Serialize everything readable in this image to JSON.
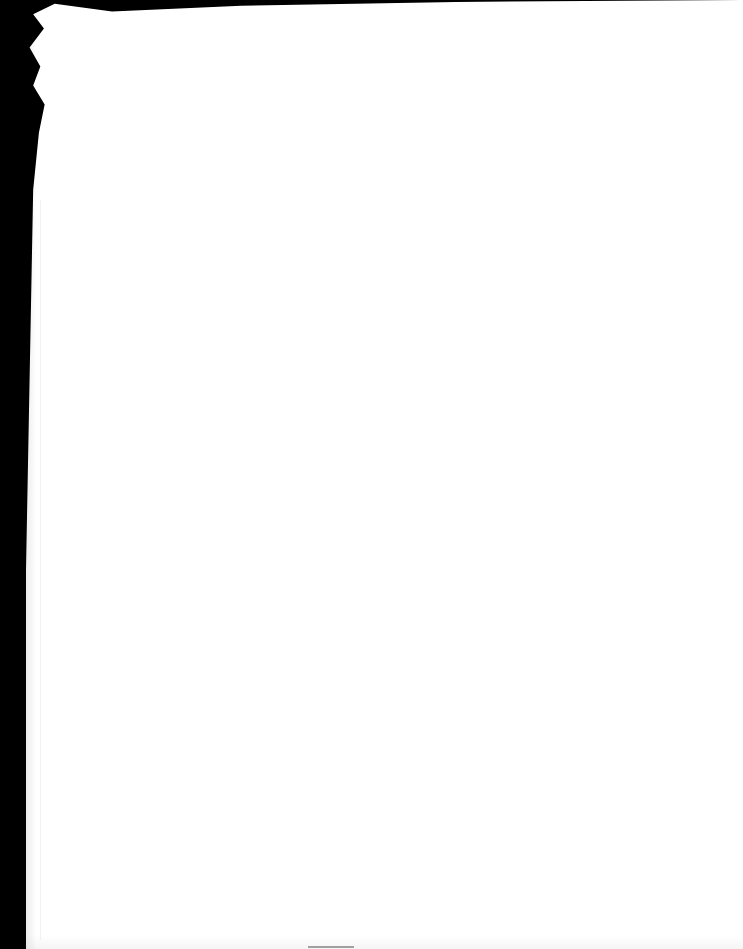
{
  "document": {
    "type": "scanned-page",
    "content": []
  }
}
